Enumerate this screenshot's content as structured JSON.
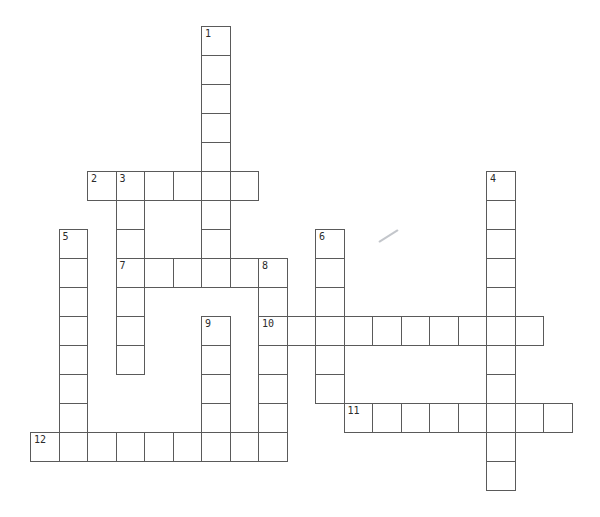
{
  "page": {
    "background": "#ffffff"
  },
  "crossword": {
    "line_color": "#5a5a5a",
    "number_color": "#2b2b2b",
    "cell_background": "#ffffff",
    "numbers_visible": [
      "1",
      "2",
      "3",
      "4",
      "5",
      "6",
      "7",
      "8",
      "9",
      "10",
      "11",
      "12"
    ],
    "entries": [
      {
        "number": "1",
        "direction": "down",
        "col": 6,
        "row": 0,
        "length": 9
      },
      {
        "number": "2",
        "direction": "across",
        "col": 2,
        "row": 5,
        "length": 6
      },
      {
        "number": "3",
        "direction": "down",
        "col": 3,
        "row": 5,
        "length": 7
      },
      {
        "number": "4",
        "direction": "down",
        "col": 16,
        "row": 5,
        "length": 11
      },
      {
        "number": "5",
        "direction": "down",
        "col": 1,
        "row": 7,
        "length": 8
      },
      {
        "number": "6",
        "direction": "down",
        "col": 10,
        "row": 7,
        "length": 6
      },
      {
        "number": "7",
        "direction": "across",
        "col": 3,
        "row": 8,
        "length": 6
      },
      {
        "number": "8",
        "direction": "down",
        "col": 8,
        "row": 8,
        "length": 7
      },
      {
        "number": "9",
        "direction": "down",
        "col": 6,
        "row": 10,
        "length": 5
      },
      {
        "number": "10",
        "direction": "across",
        "col": 8,
        "row": 10,
        "length": 10
      },
      {
        "number": "11",
        "direction": "across",
        "col": 11,
        "row": 13,
        "length": 8
      },
      {
        "number": "12",
        "direction": "across",
        "col": 0,
        "row": 14,
        "length": 9
      }
    ]
  }
}
